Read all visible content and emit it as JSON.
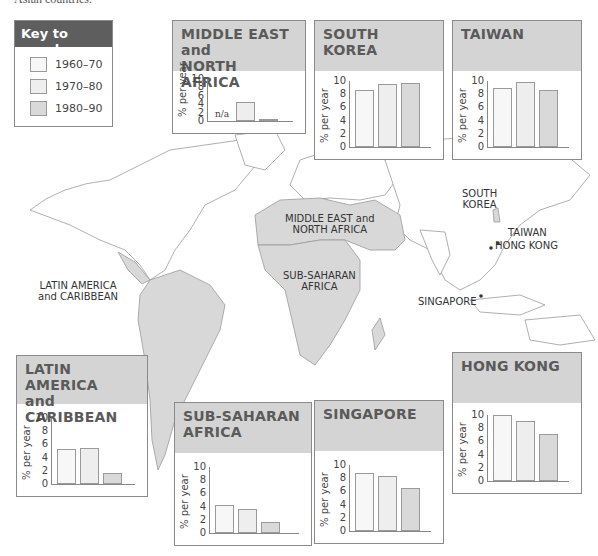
{
  "caption_fragment": "Asian countries.",
  "colors": {
    "period_1960_70": "#f7f7f7",
    "period_1970_80": "#eeeeee",
    "period_1980_90": "#d9d9d9",
    "panel_header": "#d4d4d4",
    "key_header": "#5e5e5e",
    "land_highlight": "#d8d8d8",
    "land_other": "#ffffff"
  },
  "key": {
    "title": "Key to graphs",
    "items": [
      {
        "label": "1960–70"
      },
      {
        "label": "1970–80"
      },
      {
        "label": "1980–90"
      }
    ]
  },
  "map_labels": {
    "mena": [
      "MIDDLE EAST and",
      "NORTH AFRICA"
    ],
    "ssa": [
      "SUB-SAHARAN",
      "AFRICA"
    ],
    "latam": [
      "LATIN AMERICA",
      "and CARIBBEAN"
    ],
    "korea": [
      "SOUTH",
      "KOREA"
    ],
    "taiwan": "TAIWAN",
    "hongkong": "HONG KONG",
    "singapore": "SINGAPORE"
  },
  "axis": {
    "ylabel": "% per year",
    "ticks": [
      "0",
      "2",
      "4",
      "6",
      "8",
      "10"
    ],
    "na_label": "n/a"
  },
  "chart_data": [
    {
      "type": "bar",
      "title": "MIDDLE EAST and NORTH AFRICA",
      "categories": [
        "1960–70",
        "1970–80",
        "1980–90"
      ],
      "values": [
        null,
        4.6,
        0.3
      ],
      "annotations": [
        "n/a"
      ],
      "ylabel": "% per year",
      "ylim": [
        0,
        10
      ]
    },
    {
      "type": "bar",
      "title": "SOUTH KOREA",
      "categories": [
        "1960–70",
        "1970–80",
        "1980–90"
      ],
      "values": [
        8.6,
        9.5,
        9.7
      ],
      "ylabel": "% per year",
      "ylim": [
        0,
        10
      ]
    },
    {
      "type": "bar",
      "title": "TAIWAN",
      "categories": [
        "1960–70",
        "1970–80",
        "1980–90"
      ],
      "values": [
        8.9,
        9.9,
        8.7
      ],
      "ylabel": "% per year",
      "ylim": [
        0,
        10
      ]
    },
    {
      "type": "bar",
      "title": "LATIN AMERICA and CARIBBEAN",
      "categories": [
        "1960–70",
        "1970–80",
        "1980–90"
      ],
      "values": [
        5.3,
        5.5,
        1.7
      ],
      "ylabel": "% per year",
      "ylim": [
        0,
        10
      ]
    },
    {
      "type": "bar",
      "title": "SUB-SAHARAN AFRICA",
      "categories": [
        "1960–70",
        "1970–80",
        "1980–90"
      ],
      "values": [
        4.3,
        3.6,
        1.7
      ],
      "ylabel": "% per year",
      "ylim": [
        0,
        10
      ]
    },
    {
      "type": "bar",
      "title": "SINGAPORE",
      "categories": [
        "1960–70",
        "1970–80",
        "1980–90"
      ],
      "values": [
        8.8,
        8.3,
        6.5
      ],
      "ylabel": "% per year",
      "ylim": [
        0,
        10
      ]
    },
    {
      "type": "bar",
      "title": "HONG KONG",
      "categories": [
        "1960–70",
        "1970–80",
        "1980–90"
      ],
      "values": [
        10.0,
        9.1,
        7.1
      ],
      "ylabel": "% per year",
      "ylim": [
        0,
        10
      ]
    }
  ],
  "panels": [
    {
      "id": "mena",
      "title_lines": [
        "MIDDLE EAST",
        "and",
        "NORTH AFRICA"
      ],
      "x": 172,
      "y": 20,
      "w": 132,
      "h": 112,
      "head_h": 50
    },
    {
      "id": "korea",
      "title_lines": [
        "SOUTH KOREA"
      ],
      "x": 314,
      "y": 20,
      "w": 128,
      "h": 138,
      "head_h": 50
    },
    {
      "id": "taiwan",
      "title_lines": [
        "TAIWAN"
      ],
      "x": 452,
      "y": 20,
      "w": 128,
      "h": 138,
      "head_h": 50
    },
    {
      "id": "latam",
      "title_lines": [
        "LATIN AMERICA",
        "and CARIBBEAN"
      ],
      "x": 16,
      "y": 355,
      "w": 130,
      "h": 140,
      "head_h": 48
    },
    {
      "id": "ssa",
      "title_lines": [
        "SUB-SAHARAN",
        "AFRICA"
      ],
      "x": 174,
      "y": 402,
      "w": 136,
      "h": 142,
      "head_h": 50
    },
    {
      "id": "singapore",
      "title_lines": [
        "SINGAPORE"
      ],
      "x": 314,
      "y": 400,
      "w": 128,
      "h": 142,
      "head_h": 50
    },
    {
      "id": "hongkong",
      "title_lines": [
        "HONG KONG"
      ],
      "x": 452,
      "y": 352,
      "w": 128,
      "h": 140,
      "head_h": 50
    }
  ]
}
